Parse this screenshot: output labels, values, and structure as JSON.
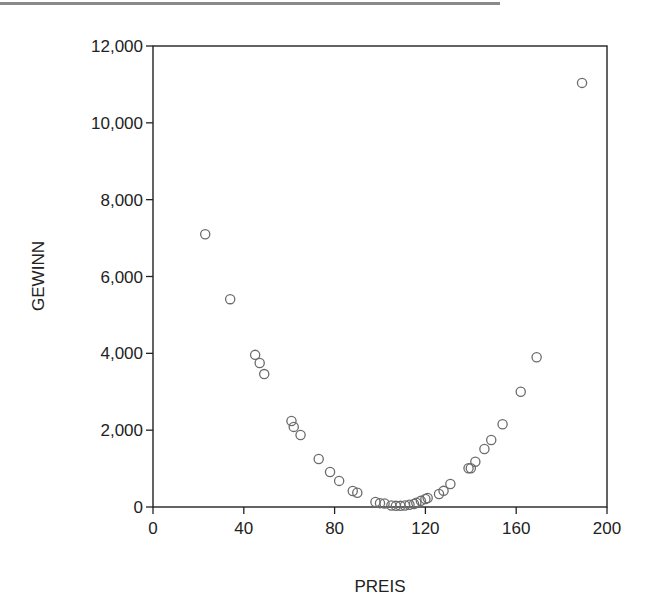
{
  "chart_data": {
    "type": "scatter",
    "title": "",
    "xlabel": "PREIS",
    "ylabel": "GEWINN",
    "xlim": [
      0,
      200
    ],
    "ylim": [
      0,
      12000
    ],
    "x_ticks": [
      0,
      40,
      80,
      120,
      160,
      200
    ],
    "x_tick_labels": [
      "0",
      "40",
      "80",
      "120",
      "160",
      "200"
    ],
    "y_ticks": [
      0,
      2000,
      4000,
      6000,
      8000,
      10000,
      12000
    ],
    "y_tick_labels": [
      "0",
      "2,000",
      "4,000",
      "6,000",
      "8,000",
      "10,000",
      "12,000"
    ],
    "grid": false,
    "legend": null,
    "marker": "open-circle",
    "series": [
      {
        "name": "GEWINN vs PREIS",
        "points": [
          {
            "x": 23,
            "y": 7100
          },
          {
            "x": 34,
            "y": 5410
          },
          {
            "x": 45,
            "y": 3960
          },
          {
            "x": 47,
            "y": 3750
          },
          {
            "x": 49,
            "y": 3460
          },
          {
            "x": 61,
            "y": 2240
          },
          {
            "x": 62,
            "y": 2085
          },
          {
            "x": 65,
            "y": 1875
          },
          {
            "x": 73,
            "y": 1250
          },
          {
            "x": 78,
            "y": 910
          },
          {
            "x": 82,
            "y": 680
          },
          {
            "x": 88,
            "y": 415
          },
          {
            "x": 90,
            "y": 370
          },
          {
            "x": 98,
            "y": 130
          },
          {
            "x": 100,
            "y": 100
          },
          {
            "x": 102,
            "y": 90
          },
          {
            "x": 105,
            "y": 40
          },
          {
            "x": 107,
            "y": 30
          },
          {
            "x": 109,
            "y": 30
          },
          {
            "x": 111,
            "y": 40
          },
          {
            "x": 113,
            "y": 60
          },
          {
            "x": 115,
            "y": 80
          },
          {
            "x": 116,
            "y": 110
          },
          {
            "x": 118,
            "y": 160
          },
          {
            "x": 120,
            "y": 210
          },
          {
            "x": 121,
            "y": 235
          },
          {
            "x": 126,
            "y": 340
          },
          {
            "x": 128,
            "y": 420
          },
          {
            "x": 131,
            "y": 600
          },
          {
            "x": 139,
            "y": 1010
          },
          {
            "x": 140,
            "y": 1010
          },
          {
            "x": 142,
            "y": 1180
          },
          {
            "x": 146,
            "y": 1510
          },
          {
            "x": 149,
            "y": 1745
          },
          {
            "x": 154,
            "y": 2155
          },
          {
            "x": 162,
            "y": 3000
          },
          {
            "x": 169,
            "y": 3900
          },
          {
            "x": 189,
            "y": 11040
          }
        ]
      }
    ],
    "colors": {
      "marker_stroke": "#6b6b6b",
      "axis": "#222222",
      "background": "#ffffff"
    }
  }
}
